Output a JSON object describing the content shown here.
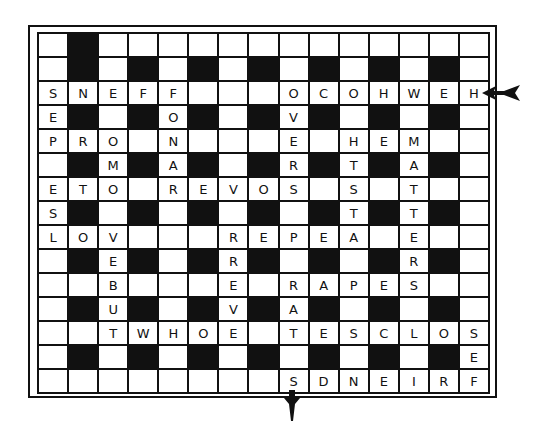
{
  "puzzle": {
    "type": "crossword-solution-grid",
    "rows": 15,
    "cols": 15,
    "black_pattern": "odd-row-odd-col",
    "grid": [
      [
        "",
        "#",
        "",
        "",
        "",
        "",
        "",
        "",
        "",
        "",
        "",
        "",
        "",
        "",
        ""
      ],
      [
        "",
        "#",
        "",
        "#",
        "",
        "#",
        "",
        "#",
        "",
        "#",
        "",
        "#",
        "",
        "#",
        ""
      ],
      [
        "S",
        "N",
        "E",
        "F",
        "F",
        "",
        "",
        "",
        "O",
        "C",
        "O",
        "H",
        "W",
        "E",
        "H"
      ],
      [
        "E",
        "#",
        "",
        "#",
        "O",
        "#",
        "",
        "#",
        "V",
        "#",
        "",
        "#",
        "",
        "#",
        ""
      ],
      [
        "P",
        "R",
        "O",
        "",
        "N",
        "",
        "",
        "",
        "E",
        "",
        "H",
        "E",
        "M",
        "",
        ""
      ],
      [
        "",
        "#",
        "M",
        "#",
        "A",
        "#",
        "",
        "#",
        "R",
        "#",
        "T",
        "#",
        "A",
        "#",
        ""
      ],
      [
        "E",
        "T",
        "O",
        "",
        "R",
        "E",
        "V",
        "O",
        "S",
        "",
        "S",
        "",
        "T",
        "",
        ""
      ],
      [
        "S",
        "#",
        "",
        "#",
        "",
        "#",
        "",
        "#",
        "",
        "#",
        "T",
        "#",
        "T",
        "#",
        ""
      ],
      [
        "L",
        "O",
        "V",
        "",
        "",
        "",
        "R",
        "E",
        "P",
        "E",
        "A",
        "",
        "E",
        "",
        ""
      ],
      [
        "",
        "#",
        "E",
        "#",
        "",
        "#",
        "R",
        "#",
        "",
        "#",
        "",
        "#",
        "R",
        "#",
        ""
      ],
      [
        "",
        "",
        "B",
        "",
        "",
        "",
        "E",
        "",
        "R",
        "A",
        "P",
        "E",
        "S",
        "",
        ""
      ],
      [
        "",
        "#",
        "U",
        "#",
        "",
        "#",
        "V",
        "#",
        "A",
        "#",
        "",
        "#",
        "",
        "#",
        ""
      ],
      [
        "",
        "",
        "T",
        "W",
        "H",
        "O",
        "E",
        "",
        "T",
        "E",
        "S",
        "C",
        "L",
        "O",
        "S"
      ],
      [
        "",
        "#",
        "",
        "#",
        "",
        "#",
        "",
        "#",
        "",
        "#",
        "",
        "#",
        "",
        "#",
        "E"
      ],
      [
        "",
        "",
        "",
        "",
        "",
        "",
        "",
        "",
        "S",
        "D",
        "N",
        "E",
        "I",
        "R",
        "F"
      ]
    ],
    "arrows": [
      {
        "name": "entry-arrow",
        "direction": "left",
        "row": 2,
        "side": "right"
      },
      {
        "name": "exit-arrow",
        "direction": "down",
        "col": 8,
        "side": "bottom"
      }
    ],
    "colors": {
      "ink": "#111111",
      "paper": "#ffffff"
    }
  }
}
